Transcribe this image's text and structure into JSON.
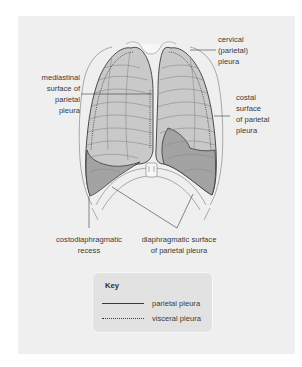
{
  "diagram": {
    "labels": {
      "cervical": [
        "cervical",
        "(parietal)",
        "pleura"
      ],
      "mediastinal": [
        "mediastinal",
        "surface of",
        "parietal",
        "pleura"
      ],
      "costal": [
        "costal",
        "surface",
        "of parietal",
        "pleura"
      ],
      "costodiaphragmatic": [
        "costodiaphragmatic",
        "recess"
      ],
      "diaphragmatic": [
        "diaphragmatic surface",
        "of parietal pleura"
      ]
    },
    "colors": {
      "panel_bg": "#efefef",
      "lung_light": "#c9c9c9",
      "lung_dark": "#a3a3a3",
      "outline": "#3a3a3a",
      "bone": "#f7f7f7",
      "key_bg": "#e2e2e2"
    }
  },
  "key": {
    "title": "Key",
    "items": [
      {
        "line": "solid",
        "label": "parietal pleura"
      },
      {
        "line": "dotted",
        "label": "visceral pleura"
      }
    ]
  }
}
